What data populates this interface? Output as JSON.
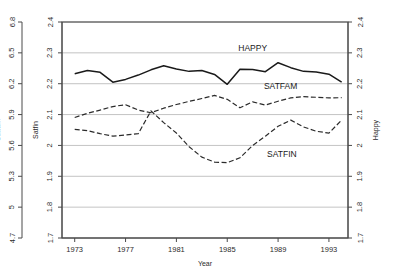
{
  "chart_data": {
    "type": "line",
    "title": "",
    "xlabel": "Year",
    "grid": true,
    "legend_position": "inline-annotations",
    "x": [
      1973,
      1974,
      1975,
      1976,
      1977,
      1978,
      1979,
      1980,
      1981,
      1982,
      1983,
      1984,
      1985,
      1986,
      1987,
      1988,
      1989,
      1990,
      1991,
      1992,
      1993,
      1994
    ],
    "xlim": [
      1972,
      1994.5
    ],
    "xticks": [
      1973,
      1977,
      1981,
      1985,
      1989,
      1993
    ],
    "xticklabels": [
      "1973",
      "1977",
      "1981",
      "1985",
      "1989",
      "1993"
    ],
    "axes": [
      {
        "id": "satfam",
        "label": "Satfam",
        "side": "left",
        "position": "outer-left",
        "lim": [
          4.7,
          6.8
        ],
        "ticks": [
          4.7,
          5.0,
          5.3,
          5.6,
          5.9,
          6.2,
          6.5,
          6.8
        ],
        "ticklabels": [
          "4.7",
          "5",
          "5.3",
          "5.6",
          "5.9",
          "6.2",
          "6.5",
          "6.8"
        ]
      },
      {
        "id": "satfin",
        "label": "Satfin",
        "side": "left",
        "position": "inner-left",
        "lim": [
          1.7,
          2.4
        ],
        "ticks": [
          1.7,
          1.8,
          1.9,
          2.0,
          2.1,
          2.2,
          2.3,
          2.4
        ],
        "ticklabels": [
          "1.7",
          "1.8",
          "1.9",
          "2",
          "2.1",
          "2.2",
          "2.3",
          "2.4"
        ]
      },
      {
        "id": "happy",
        "label": "Happy",
        "side": "right",
        "position": "right",
        "lim": [
          1.7,
          2.4
        ],
        "ticks": [
          1.7,
          1.8,
          1.9,
          2.0,
          2.1,
          2.2,
          2.3,
          2.4
        ],
        "ticklabels": [
          "1.7",
          "1.8",
          "1.9",
          "2",
          "2.1",
          "2.2",
          "2.3",
          "2.4"
        ]
      }
    ],
    "series": [
      {
        "name": "HAPPY",
        "axis": "happy",
        "style": "solid",
        "color": "#1a1a1a",
        "label_text": "HAPPY",
        "label_x": 1987.0,
        "label_y": 2.305,
        "values": [
          2.232,
          2.243,
          2.237,
          2.205,
          2.214,
          2.228,
          2.245,
          2.258,
          2.248,
          2.24,
          2.243,
          2.23,
          2.198,
          2.247,
          2.246,
          2.239,
          2.268,
          2.252,
          2.24,
          2.238,
          2.231,
          2.205
        ]
      },
      {
        "name": "SATFAM",
        "axis": "satfam",
        "style": "dashed",
        "color": "#2b2b2b",
        "label_text": "SATFAM",
        "label_x": 1989.2,
        "label_y": 6.145,
        "values": [
          5.872,
          5.912,
          5.944,
          5.978,
          5.996,
          5.944,
          5.918,
          5.962,
          5.998,
          6.028,
          6.056,
          6.086,
          6.048,
          5.966,
          6.024,
          5.992,
          6.03,
          6.062,
          6.074,
          6.068,
          6.062,
          6.064
        ]
      },
      {
        "name": "SATFIN",
        "axis": "satfin",
        "style": "dashed",
        "color": "#2b2b2b",
        "label_text": "SATFIN",
        "label_x": 1989.3,
        "label_y": 1.962,
        "values": [
          2.052,
          2.048,
          2.038,
          2.03,
          2.034,
          2.038,
          2.112,
          2.074,
          2.04,
          1.996,
          1.962,
          1.946,
          1.944,
          1.96,
          2.0,
          2.03,
          2.062,
          2.082,
          2.06,
          2.046,
          2.04,
          2.082
        ]
      }
    ]
  }
}
